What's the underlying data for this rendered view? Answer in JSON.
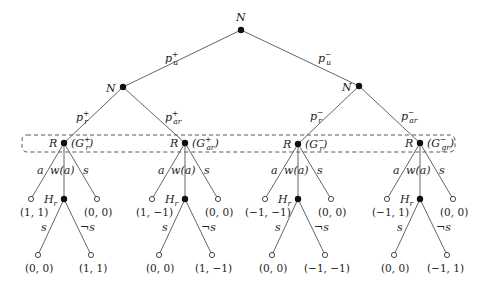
{
  "diagram": {
    "type": "game-tree",
    "root": {
      "label": "N"
    },
    "chance_branches": [
      {
        "prob": "p",
        "sup": "+",
        "sub": "u"
      },
      {
        "prob": "p",
        "sup": "−",
        "sub": "u"
      }
    ],
    "second_level": [
      {
        "label": "N",
        "branches": [
          {
            "prob": "p",
            "sup": "+",
            "sub": "r"
          },
          {
            "prob": "p",
            "sup": "+",
            "sub": "ar"
          }
        ]
      },
      {
        "label": "N",
        "branches": [
          {
            "prob": "p",
            "sup": "−",
            "sub": "r"
          },
          {
            "prob": "p",
            "sup": "−",
            "sub": "ar"
          }
        ]
      }
    ],
    "information_set": "dashed-rounded-box",
    "receiver_nodes": [
      {
        "label": "R",
        "game": "G",
        "game_sup": "+",
        "game_sub": "r",
        "actions": [
          "a",
          "w(a)",
          "s"
        ],
        "a_payoff": "(1, 1)",
        "s_payoff": "(0, 0)",
        "hr": {
          "label": "H",
          "label_sub": "r",
          "actions": [
            "s",
            "¬s"
          ],
          "payoffs": [
            "(0, 0)",
            "(1, 1)"
          ]
        }
      },
      {
        "label": "R",
        "game": "G",
        "game_sup": "+",
        "game_sub": "ar",
        "actions": [
          "a",
          "w(a)",
          "s"
        ],
        "a_payoff": "(1, −1)",
        "s_payoff": "(0, 0)",
        "hr": {
          "label": "H",
          "label_sub": "r",
          "actions": [
            "s",
            "¬s"
          ],
          "payoffs": [
            "(0, 0)",
            "(1, −1)"
          ]
        }
      },
      {
        "label": "R",
        "game": "G",
        "game_sup": "−",
        "game_sub": "r",
        "actions": [
          "a",
          "w(a)",
          "s"
        ],
        "a_payoff": "(−1, −1)",
        "s_payoff": "(0, 0)",
        "hr": {
          "label": "H",
          "label_sub": "r",
          "actions": [
            "s",
            "¬s"
          ],
          "payoffs": [
            "(0, 0)",
            "(−1, −1)"
          ]
        }
      },
      {
        "label": "R",
        "game": "G",
        "game_sup": "−",
        "game_sub": "gr",
        "actions": [
          "a",
          "w(a)",
          "s"
        ],
        "a_payoff": "(−1, 1)",
        "s_payoff": "(0, 0)",
        "hr": {
          "label": "H",
          "label_sub": "r",
          "actions": [
            "s",
            "¬s"
          ],
          "payoffs": [
            "(0, 0)",
            "(−1, 1)"
          ]
        }
      }
    ]
  }
}
